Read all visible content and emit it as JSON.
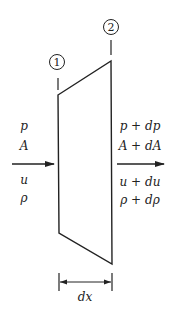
{
  "diagram": {
    "type": "control-volume-flow",
    "stations": [
      {
        "id": "station-1",
        "label": "1"
      },
      {
        "id": "station-2",
        "label": "2"
      }
    ],
    "inlet": {
      "above_arrow": [
        "p",
        "A"
      ],
      "below_arrow": [
        "u",
        "ρ"
      ]
    },
    "outlet": {
      "above_arrow": [
        "p + dp",
        "A + dA"
      ],
      "below_arrow": [
        "u + du",
        "ρ + dρ"
      ]
    },
    "dimension_label": "dx",
    "colors": {
      "stroke": "#222222",
      "background": "#ffffff"
    }
  }
}
